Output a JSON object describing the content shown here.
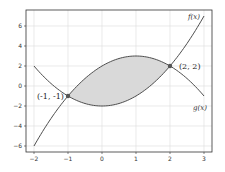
{
  "chart_data": {
    "type": "line",
    "title": "",
    "xlabel": "",
    "ylabel": "",
    "xlim": [
      -2.25,
      3.25
    ],
    "ylim": [
      -6.4,
      7.6
    ],
    "grid": true,
    "x_ticks": [
      "-2",
      "-1",
      "0",
      "1",
      "2",
      "3"
    ],
    "y_ticks": [
      "6",
      "4",
      "2",
      "0",
      "-2",
      "-4",
      "-6"
    ],
    "series": [
      {
        "name": "f(x)",
        "expression": "x^2 - 2",
        "x": [
          -2,
          -1,
          0,
          1,
          2,
          3
        ],
        "values": [
          2,
          -1,
          -2,
          -1,
          2,
          7
        ]
      },
      {
        "name": "g(x)",
        "expression": "-x^2 + 2x + 2",
        "x": [
          -2,
          -1,
          0,
          1,
          2,
          3
        ],
        "values": [
          -6,
          -1,
          2,
          3,
          2,
          -1
        ]
      }
    ],
    "shaded_region": {
      "between": [
        "f(x)",
        "g(x)"
      ],
      "x_range": [
        -1,
        2
      ]
    },
    "annotations": [
      {
        "text": "(-1, -1)",
        "x": -1,
        "y": -1
      },
      {
        "text": "(2, 2)",
        "x": 2,
        "y": 2
      }
    ],
    "curve_labels": [
      {
        "text": "f(x)",
        "near": [
          3,
          7
        ]
      },
      {
        "text": "g(x)",
        "near": [
          3,
          -1
        ]
      }
    ]
  },
  "colors": {
    "curve": "#4d4d4d",
    "fill": "#d9d9d9",
    "grid": "#dcdcdc",
    "point": "#555555"
  }
}
